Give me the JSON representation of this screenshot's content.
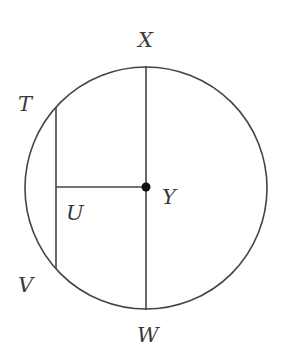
{
  "diagram": {
    "type": "circle-geometry",
    "stroke_color": "#444444",
    "circle": {
      "center": "Y",
      "cx": 146,
      "cy": 188,
      "r": 121
    },
    "points": {
      "X": {
        "x": 146,
        "y": 66
      },
      "W": {
        "x": 146,
        "y": 310
      },
      "Y": {
        "x": 146,
        "y": 187
      },
      "T": {
        "x": 56,
        "y": 107
      },
      "V": {
        "x": 56,
        "y": 269
      },
      "U": {
        "x": 56,
        "y": 187
      }
    },
    "segments": [
      {
        "name": "XW",
        "from": "X",
        "to": "W",
        "note": "diameter"
      },
      {
        "name": "TV",
        "from": "T",
        "to": "V",
        "note": "chord"
      },
      {
        "name": "UY",
        "from": "U",
        "to": "Y",
        "note": "perpendicular from center to chord"
      }
    ],
    "labels": {
      "X": "X",
      "T": "T",
      "Y": "Y",
      "U": "U",
      "V": "V",
      "W": "W"
    }
  }
}
